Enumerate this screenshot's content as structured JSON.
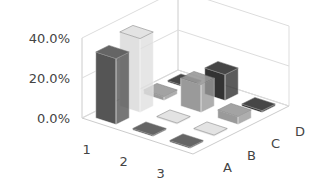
{
  "chart_data": {
    "type": "bar",
    "subtype": "3d-column",
    "title": "",
    "categories": [
      "1",
      "2",
      "3"
    ],
    "series": [
      {
        "name": "A",
        "color": "#555555",
        "values": [
          33,
          0,
          0
        ]
      },
      {
        "name": "B",
        "color": "#e0e0e0",
        "values": [
          37,
          0,
          0
        ]
      },
      {
        "name": "C",
        "color": "#9a9a9a",
        "values": [
          2,
          14,
          4
        ]
      },
      {
        "name": "D",
        "color": "#333333",
        "values": [
          0,
          13,
          1
        ]
      }
    ],
    "ylim": [
      0,
      40
    ],
    "yticks": [
      "0.0%",
      "20.0%",
      "40.0%"
    ],
    "ytick_values": [
      0,
      20,
      40
    ],
    "grid": true,
    "legend": "none"
  }
}
